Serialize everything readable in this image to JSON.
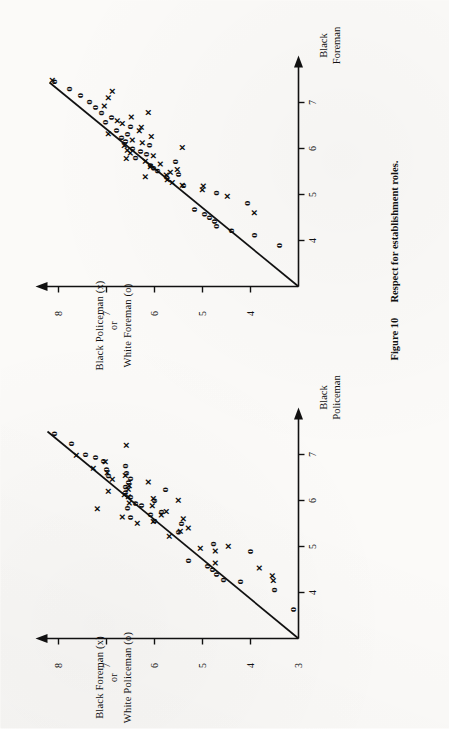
{
  "figure": {
    "number": "Figure 10",
    "caption": "Respect for establishment roles."
  },
  "panels": [
    {
      "id": "left-panel",
      "ylabel_line1": "Black Foreman (x)",
      "ylabel_or": "or",
      "ylabel_line2": "White Policeman (o)",
      "xlabel_line1": "Black",
      "xlabel_line2": "Policeman",
      "y_ticks": [
        "3",
        "4",
        "5",
        "6",
        "7",
        "8"
      ],
      "x_ticks": [
        "4",
        "5",
        "6",
        "7"
      ],
      "origin_label": "3"
    },
    {
      "id": "right-panel",
      "ylabel_line1": "Black Policeman (x)",
      "ylabel_or": "or",
      "ylabel_line2": "White Foreman (o)",
      "xlabel_line1": "Black",
      "xlabel_line2": "Foreman",
      "y_ticks": [
        "4",
        "5",
        "6",
        "7",
        "8"
      ],
      "x_ticks": [
        "4",
        "5",
        "6",
        "7"
      ],
      "origin_label": ""
    }
  ],
  "chart_data": [
    {
      "id": "left-panel",
      "type": "scatter",
      "title": "Black Foreman (x) or White Policeman (o) vs Black Policeman",
      "xlabel": "Black Policeman",
      "ylabel": "Black Foreman (x) or White Policeman (o)",
      "xlim": [
        3,
        7.6
      ],
      "ylim": [
        3,
        8.4
      ],
      "xticks": [
        4,
        5,
        6,
        7
      ],
      "yticks": [
        4,
        5,
        6,
        7,
        8
      ],
      "grid": false,
      "legend": "inline-in-axis-label",
      "reference_line": {
        "label": "y = x identity line",
        "from": [
          3.0,
          3.0
        ],
        "to": [
          7.55,
          8.15
        ]
      },
      "series": [
        {
          "name": "Black Foreman (x)",
          "marker": "x",
          "points": [
            [
              4.28,
              3.52
            ],
            [
              4.38,
              3.54
            ],
            [
              4.55,
              3.82
            ],
            [
              4.66,
              4.72
            ],
            [
              4.92,
              4.72
            ],
            [
              4.98,
              5.05
            ],
            [
              5.02,
              4.45
            ],
            [
              5.24,
              5.68
            ],
            [
              5.35,
              5.46
            ],
            [
              5.42,
              5.3
            ],
            [
              5.52,
              6.36
            ],
            [
              5.56,
              6.02
            ],
            [
              5.62,
              5.4
            ],
            [
              5.66,
              6.66
            ],
            [
              5.7,
              5.86
            ],
            [
              5.78,
              5.76
            ],
            [
              5.84,
              7.18
            ],
            [
              5.9,
              6.04
            ],
            [
              5.96,
              6.52
            ],
            [
              6.02,
              5.5
            ],
            [
              6.06,
              6.02
            ],
            [
              6.1,
              6.55
            ],
            [
              6.14,
              6.62
            ],
            [
              6.22,
              6.95
            ],
            [
              6.26,
              6.55
            ],
            [
              6.34,
              6.52
            ],
            [
              6.42,
              6.12
            ],
            [
              6.48,
              6.88
            ],
            [
              6.56,
              6.6
            ],
            [
              6.62,
              6.98
            ],
            [
              6.72,
              7.28
            ],
            [
              6.86,
              7.02
            ],
            [
              7.0,
              7.62
            ],
            [
              7.22,
              6.58
            ]
          ]
        },
        {
          "name": "White Policeman (o)",
          "marker": "o",
          "points": [
            [
              3.66,
              3.12
            ],
            [
              4.08,
              3.52
            ],
            [
              4.26,
              4.22
            ],
            [
              4.3,
              4.58
            ],
            [
              4.42,
              4.72
            ],
            [
              4.52,
              4.82
            ],
            [
              4.6,
              4.92
            ],
            [
              4.72,
              5.32
            ],
            [
              4.92,
              4.02
            ],
            [
              5.08,
              4.8
            ],
            [
              5.34,
              5.52
            ],
            [
              5.52,
              5.46
            ],
            [
              5.58,
              6.02
            ],
            [
              5.66,
              6.52
            ],
            [
              5.72,
              6.1
            ],
            [
              5.78,
              5.88
            ],
            [
              5.86,
              6.58
            ],
            [
              5.92,
              6.3
            ],
            [
              5.96,
              6.42
            ],
            [
              6.02,
              6.02
            ],
            [
              6.1,
              6.52
            ],
            [
              6.2,
              6.62
            ],
            [
              6.26,
              5.8
            ],
            [
              6.32,
              6.62
            ],
            [
              6.42,
              6.56
            ],
            [
              6.5,
              6.52
            ],
            [
              6.56,
              6.98
            ],
            [
              6.62,
              6.6
            ],
            [
              6.7,
              7.02
            ],
            [
              6.78,
              6.62
            ],
            [
              6.88,
              7.08
            ],
            [
              6.96,
              7.26
            ],
            [
              7.02,
              7.46
            ],
            [
              7.26,
              7.74
            ],
            [
              7.48,
              8.1
            ]
          ]
        }
      ]
    },
    {
      "id": "right-panel",
      "type": "scatter",
      "title": "Black Policeman (x) or White Foreman (o) vs Black Foreman",
      "xlabel": "Black Foreman",
      "ylabel": "Black Policeman (x) or White Foreman (o)",
      "xlim": [
        3,
        7.6
      ],
      "ylim": [
        3,
        8.4
      ],
      "xticks": [
        4,
        5,
        6,
        7
      ],
      "yticks": [
        4,
        5,
        6,
        7,
        8
      ],
      "grid": false,
      "legend": "inline-in-axis-label",
      "reference_line": {
        "label": "y = x identity line",
        "from": [
          3.0,
          3.0
        ],
        "to": [
          7.52,
          8.12
        ]
      },
      "series": [
        {
          "name": "Black Policeman (x)",
          "marker": "x",
          "points": [
            [
              4.62,
              3.92
            ],
            [
              4.98,
              4.48
            ],
            [
              5.12,
              5.0
            ],
            [
              5.2,
              4.98
            ],
            [
              5.22,
              5.42
            ],
            [
              5.28,
              5.62
            ],
            [
              5.34,
              5.72
            ],
            [
              5.4,
              6.18
            ],
            [
              5.44,
              5.74
            ],
            [
              5.5,
              5.66
            ],
            [
              5.56,
              5.52
            ],
            [
              5.62,
              6.08
            ],
            [
              5.68,
              5.88
            ],
            [
              5.74,
              6.18
            ],
            [
              5.8,
              6.58
            ],
            [
              5.86,
              6.02
            ],
            [
              5.92,
              6.5
            ],
            [
              5.98,
              6.56
            ],
            [
              6.04,
              5.42
            ],
            [
              6.08,
              6.62
            ],
            [
              6.14,
              6.24
            ],
            [
              6.2,
              6.46
            ],
            [
              6.28,
              6.06
            ],
            [
              6.34,
              6.96
            ],
            [
              6.4,
              6.32
            ],
            [
              6.48,
              6.28
            ],
            [
              6.56,
              6.66
            ],
            [
              6.62,
              6.78
            ],
            [
              6.7,
              6.48
            ],
            [
              6.8,
              6.12
            ],
            [
              6.94,
              7.04
            ],
            [
              7.12,
              6.96
            ],
            [
              7.26,
              6.88
            ],
            [
              7.5,
              8.12
            ]
          ]
        },
        {
          "name": "White Foreman (o)",
          "marker": "o",
          "points": [
            [
              3.92,
              3.42
            ],
            [
              4.14,
              3.94
            ],
            [
              4.24,
              4.42
            ],
            [
              4.34,
              4.72
            ],
            [
              4.44,
              4.78
            ],
            [
              4.52,
              4.88
            ],
            [
              4.6,
              4.98
            ],
            [
              4.7,
              5.18
            ],
            [
              4.84,
              4.08
            ],
            [
              5.06,
              4.72
            ],
            [
              5.22,
              5.42
            ],
            [
              5.4,
              5.78
            ],
            [
              5.46,
              5.52
            ],
            [
              5.54,
              5.96
            ],
            [
              5.6,
              6.04
            ],
            [
              5.66,
              6.1
            ],
            [
              5.74,
              5.58
            ],
            [
              5.82,
              6.42
            ],
            [
              5.9,
              6.18
            ],
            [
              5.96,
              6.32
            ],
            [
              6.02,
              6.48
            ],
            [
              6.1,
              6.12
            ],
            [
              6.18,
              6.62
            ],
            [
              6.26,
              6.7
            ],
            [
              6.34,
              6.58
            ],
            [
              6.42,
              6.82
            ],
            [
              6.5,
              6.52
            ],
            [
              6.6,
              7.04
            ],
            [
              6.7,
              6.92
            ],
            [
              6.8,
              7.12
            ],
            [
              6.92,
              7.26
            ],
            [
              7.04,
              7.38
            ],
            [
              7.18,
              7.56
            ],
            [
              7.32,
              7.8
            ],
            [
              7.48,
              8.1
            ]
          ]
        }
      ]
    }
  ]
}
